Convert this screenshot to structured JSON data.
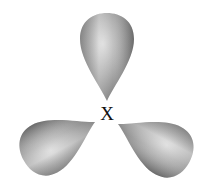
{
  "diagram": {
    "type": "sp2 hybrid orbitals (trigonal planar)",
    "center_atom_label": "X",
    "lobes": [
      {
        "name": "top",
        "angle_deg": 0
      },
      {
        "name": "bottom-left",
        "angle_deg": -118
      },
      {
        "name": "bottom-right",
        "angle_deg": 118
      }
    ],
    "colors": {
      "lobe_light": "#d8d8d8",
      "lobe_mid": "#a8a8a8",
      "lobe_dark": "#6e6e6e",
      "label": "#111111",
      "background": "#ffffff"
    }
  }
}
